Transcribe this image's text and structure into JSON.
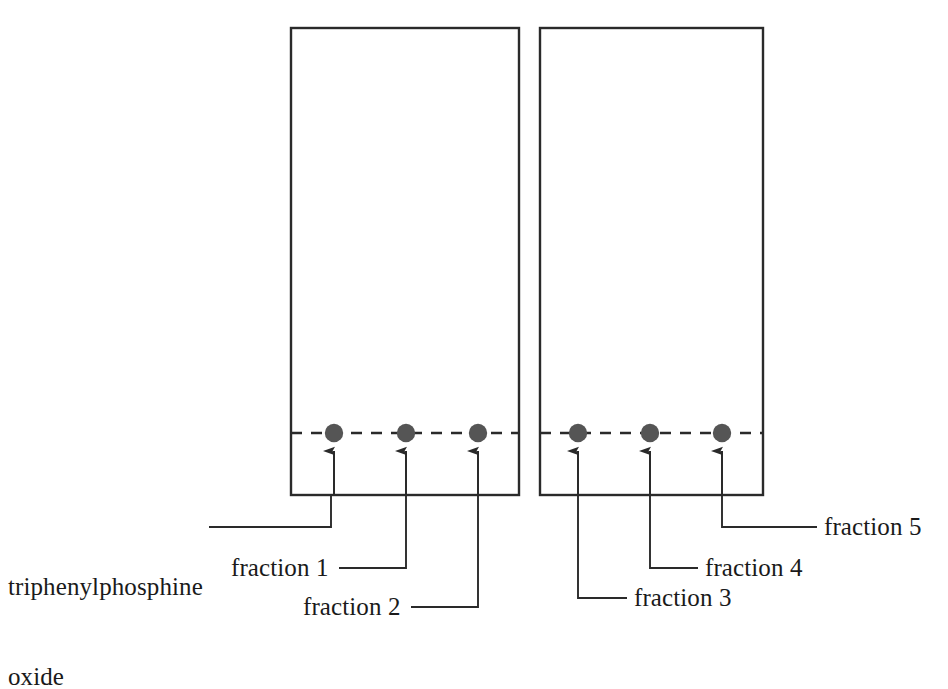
{
  "figure": {
    "kind": "tlc-plate-diagram",
    "background_color": "#ffffff",
    "ink_color": "#2a2a2a",
    "spot_color": "#555555",
    "width": 948,
    "height": 649
  },
  "plates": [
    {
      "id": "plate-left",
      "name": "left-tlc-plate",
      "x": 291,
      "y": 28,
      "width": 228,
      "height": 467,
      "baseline_y": 433,
      "spots_x": [
        334,
        406,
        478
      ]
    },
    {
      "id": "plate-right",
      "name": "right-tlc-plate",
      "x": 540,
      "y": 28,
      "width": 223,
      "height": 467,
      "baseline_y": 433,
      "spots_x": [
        578,
        650,
        722
      ]
    }
  ],
  "spots": [
    {
      "name": "spot-triphenylphosphine-oxide",
      "cx": 334,
      "cy": 433,
      "r": 9
    },
    {
      "name": "spot-fraction-1",
      "cx": 406,
      "cy": 433,
      "r": 9
    },
    {
      "name": "spot-fraction-2",
      "cx": 478,
      "cy": 433,
      "r": 9
    },
    {
      "name": "spot-fraction-3",
      "cx": 578,
      "cy": 433,
      "r": 9
    },
    {
      "name": "spot-fraction-4",
      "cx": 650,
      "cy": 433,
      "r": 9
    },
    {
      "name": "spot-fraction-5",
      "cx": 722,
      "cy": 433,
      "r": 9
    }
  ],
  "arrows": [
    {
      "name": "arrow-to-triphenylphosphine-oxide-spot",
      "x": 334,
      "tip_y": 450,
      "tail_y": 495
    },
    {
      "name": "arrow-to-fraction-1-spot",
      "x": 406,
      "tip_y": 450,
      "tail_y": 495
    },
    {
      "name": "arrow-to-fraction-2-spot",
      "x": 478,
      "tip_y": 450,
      "tail_y": 495
    },
    {
      "name": "arrow-to-fraction-3-spot",
      "x": 578,
      "tip_y": 450,
      "tail_y": 495
    },
    {
      "name": "arrow-to-fraction-4-spot",
      "x": 650,
      "tip_y": 450,
      "tail_y": 495
    },
    {
      "name": "arrow-to-fraction-5-spot",
      "x": 722,
      "tip_y": 450,
      "tail_y": 495
    }
  ],
  "leaders": [
    {
      "name": "leader-triphenylphosphine-oxide",
      "points": "209,527 331,527 331,495"
    },
    {
      "name": "leader-fraction-1",
      "points": "339,568 408,568 408,495"
    },
    {
      "name": "leader-fraction-2",
      "points": "409,607 478,607 478,495"
    },
    {
      "name": "leader-fraction-3",
      "points": "578,495 578,598 627,598"
    },
    {
      "name": "leader-fraction-4",
      "points": "650,495 650,568 697,568"
    },
    {
      "name": "leader-fraction-5",
      "points": "722,495 722,527 817,527"
    }
  ],
  "labels": [
    {
      "name": "label-triphenylphosphine-oxide",
      "line1": "triphenylphosphine",
      "line2": "oxide",
      "x": 8,
      "y": 512,
      "align": "left"
    },
    {
      "name": "label-fraction-1",
      "line1": "fraction 1",
      "line2": "",
      "x": 231,
      "y": 553,
      "align": "left"
    },
    {
      "name": "label-fraction-2",
      "line1": "fraction 2",
      "line2": "",
      "x": 303,
      "y": 592,
      "align": "left"
    },
    {
      "name": "label-fraction-3",
      "line1": "fraction 3",
      "line2": "",
      "x": 634,
      "y": 583,
      "align": "left"
    },
    {
      "name": "label-fraction-4",
      "line1": "fraction 4",
      "line2": "",
      "x": 705,
      "y": 553,
      "align": "left"
    },
    {
      "name": "label-fraction-5",
      "line1": "fraction 5",
      "line2": "",
      "x": 824,
      "y": 512,
      "align": "left"
    }
  ]
}
